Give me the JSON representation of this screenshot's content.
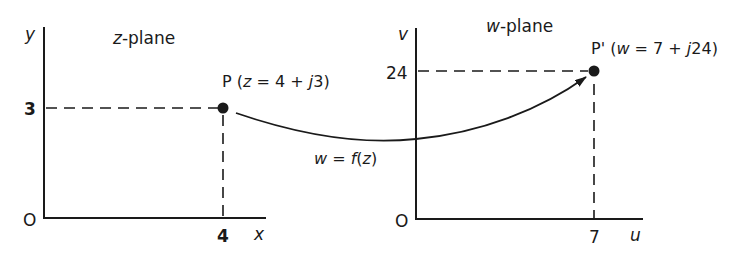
{
  "z_plane": {
    "title_var": "z",
    "title_rest": "-plane",
    "x_axis_label": "x",
    "y_axis_label": "y",
    "origin_label": "O",
    "x_tick": "4",
    "y_tick": "3",
    "point": {
      "name": "P",
      "open": " (",
      "var": "z",
      "eq": " = 4 + ",
      "j": "j",
      "num": "3",
      "close": ")"
    }
  },
  "w_plane": {
    "title_var": "w",
    "title_rest": "-plane",
    "x_axis_label": "u",
    "y_axis_label": "v",
    "origin_label": "O",
    "x_tick": "7",
    "y_tick": "24",
    "point": {
      "name": "P'",
      "open": " (",
      "var": "w",
      "eq": " = 7 + ",
      "j": "j",
      "num": "24",
      "close": ")"
    }
  },
  "mapping": {
    "lhs": "w",
    "eq": " = ",
    "f": "f",
    "open": "(",
    "var": "z",
    "close": ")"
  },
  "colors": {
    "ink": "#1a1a1a",
    "background": "#ffffff"
  }
}
